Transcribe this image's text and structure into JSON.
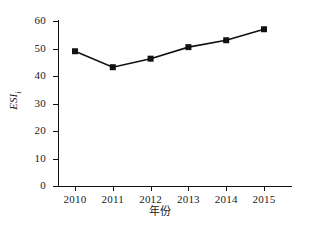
{
  "chart_data": {
    "type": "line",
    "title": "",
    "xlabel": "年份",
    "ylabel": "ESI_i",
    "ylabel_main": "ESI",
    "ylabel_sub": "i",
    "categories": [
      "2010",
      "2011",
      "2012",
      "2013",
      "2014",
      "2015"
    ],
    "values": [
      49,
      43.2,
      46.3,
      50.5,
      53,
      57
    ],
    "series": [
      {
        "name": "ESI_i",
        "values": [
          49,
          43.2,
          46.3,
          50.5,
          53,
          57
        ]
      }
    ],
    "ylim": [
      0,
      60
    ],
    "y_ticks": [
      0,
      10,
      20,
      30,
      40,
      50,
      60
    ],
    "y_tick_labels": [
      "0",
      "10",
      "20",
      "30",
      "40",
      "50",
      "60"
    ],
    "x_tick_labels": [
      "2010",
      "2011",
      "2012",
      "2013",
      "2014",
      "2015"
    ],
    "grid": false,
    "legend": false,
    "legend_position": "none",
    "marker": "square",
    "line_color": "#111111",
    "marker_color": "#111111",
    "background_color": "#ffffff"
  }
}
